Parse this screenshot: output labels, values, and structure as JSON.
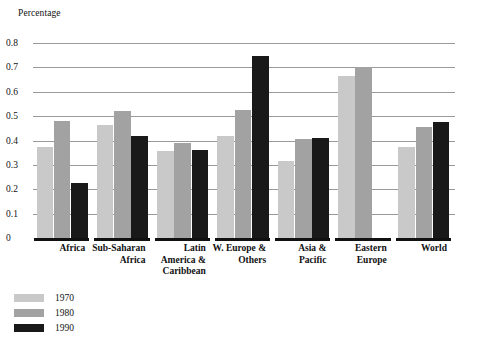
{
  "chart_data": {
    "type": "bar",
    "title": "",
    "ylabel": "Percentage",
    "xlabel": "",
    "ylim": [
      0,
      0.8
    ],
    "ytick_labels": [
      "0",
      "0.1",
      "0.2",
      "0.3",
      "0.4",
      "0.5",
      "0.6",
      "0.7",
      "0.8"
    ],
    "ytick_values": [
      0,
      0.1,
      0.2,
      0.3,
      0.4,
      0.5,
      0.6,
      0.7,
      0.8
    ],
    "grid": true,
    "legend_position": "bottom-left",
    "categories": [
      "Africa",
      "Sub-Saharan Africa",
      "Latin America & Caribbean",
      "W. Europe & Others",
      "Asia & Pacific",
      "Eastern Europe",
      "World"
    ],
    "category_label_lines": [
      [
        "Africa"
      ],
      [
        "Sub-Saharan",
        "Africa"
      ],
      [
        "Latin",
        "America &",
        "Caribbean"
      ],
      [
        "W. Europe &",
        "Others"
      ],
      [
        "Asia &",
        "Pacific"
      ],
      [
        "Eastern",
        "Europe"
      ],
      [
        "World"
      ]
    ],
    "series": [
      {
        "name": "1970",
        "color": "#c9c9c9",
        "values": [
          0.375,
          0.465,
          0.355,
          0.42,
          0.315,
          0.665,
          0.375
        ]
      },
      {
        "name": "1980",
        "color": "#a2a2a2",
        "values": [
          0.48,
          0.52,
          0.39,
          0.525,
          0.405,
          0.7,
          0.455
        ]
      },
      {
        "name": "1990",
        "color": "#191919",
        "values": [
          0.225,
          0.42,
          0.36,
          0.745,
          0.41,
          0.0,
          0.475
        ]
      }
    ]
  },
  "legend": {
    "items": [
      {
        "label": "1970",
        "color": "#c9c9c9"
      },
      {
        "label": "1980",
        "color": "#a2a2a2"
      },
      {
        "label": "1990",
        "color": "#191919"
      }
    ]
  }
}
